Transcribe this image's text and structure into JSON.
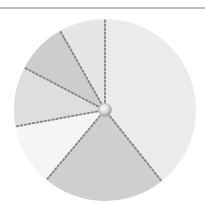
{
  "chart_data": {
    "type": "pie",
    "title": "",
    "legend": [],
    "labels_visible": false,
    "start_angle_deg": 0,
    "direction": "clockwise",
    "center": [
      105,
      110
    ],
    "radius": 91,
    "slices": [
      {
        "name": "Slice 1",
        "value": 39.3,
        "color": "#ebebeb"
      },
      {
        "name": "Slice 2",
        "value": 21.8,
        "color": "#cfcfcf"
      },
      {
        "name": "Slice 3",
        "value": 11.0,
        "color": "#f5f5f5"
      },
      {
        "name": "Slice 4",
        "value": 10.6,
        "color": "#dedede"
      },
      {
        "name": "Slice 5",
        "value": 9.1,
        "color": "#cdcdcd"
      },
      {
        "name": "Slice 6",
        "value": 8.2,
        "color": "#e6e6e6"
      }
    ],
    "separator_style": "dotted",
    "separator_color": "#8a8a8a",
    "center_knob": true
  }
}
